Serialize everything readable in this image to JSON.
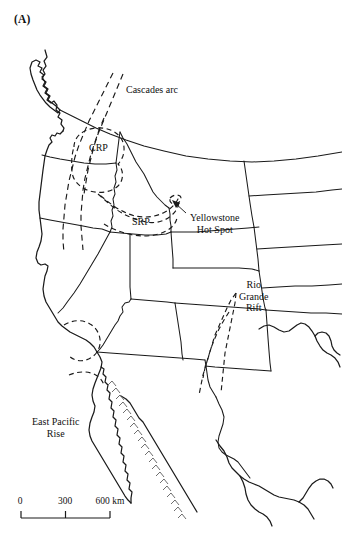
{
  "figure": {
    "panel_letter": "(A)",
    "type": "line map of western North America showing Cenozoic volcanic and extensional tectonic features"
  },
  "map": {
    "labels": [
      {
        "id": "cascades-arc",
        "text": "Cascades arc",
        "x": 126,
        "y": 90,
        "align": "left"
      },
      {
        "id": "crp",
        "text": "CRP",
        "x": 89,
        "y": 148,
        "align": "left"
      },
      {
        "id": "srp",
        "text": "SRP",
        "x": 132,
        "y": 222,
        "align": "left"
      },
      {
        "id": "yellowstone-hot-spot",
        "text": "Yellowstone\nHot Spot",
        "x": 190,
        "y": 215,
        "align": "left"
      },
      {
        "id": "rio-grande-rift",
        "text": "Rio\nGrande\nRift",
        "x": 239,
        "y": 281,
        "align": "left"
      },
      {
        "id": "east-pacific-rise",
        "text": "East Pacific\nRise",
        "x": 32,
        "y": 420,
        "align": "left"
      }
    ],
    "feature_names": {
      "cascades_arc": "Cascades arc",
      "crp": "CRP",
      "srp": "SRP",
      "yellowstone_hot_spot": "Yellowstone Hot Spot",
      "rio_grande_rift": "Rio Grande Rift",
      "east_pacific_rise": "East Pacific Rise"
    }
  },
  "scale": {
    "tick_0": "0",
    "tick_300": "300",
    "tick_600": "600 km",
    "unit": "km",
    "values": [
      0,
      300,
      600
    ]
  },
  "colors": {
    "background": "#ffffff",
    "line": "#1a1a1a",
    "ridge_hatch": "#555555",
    "text": "#111111"
  }
}
